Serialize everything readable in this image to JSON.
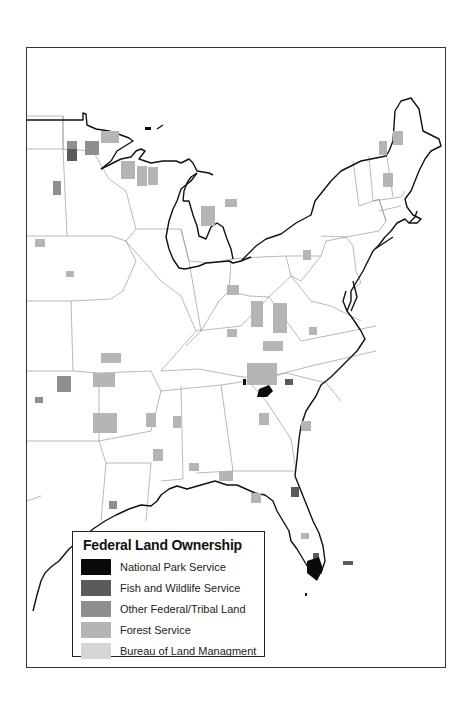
{
  "map": {
    "subject": "Eastern United States",
    "frame": {
      "left": 26,
      "top": 47,
      "right": 448,
      "bottom": 670
    }
  },
  "legend": {
    "title": "Federal Land Ownership",
    "items": [
      {
        "label": "National Park Service",
        "color": "#0a0a0a",
        "icon": "national-park-service-swatch"
      },
      {
        "label": "Fish and Wildlife Service",
        "color": "#5a5a5a",
        "icon": "fish-wildlife-service-swatch"
      },
      {
        "label": "Other Federal/Tribal Land",
        "color": "#8f8f8f",
        "icon": "other-federal-tribal-swatch"
      },
      {
        "label": "Forest Service",
        "color": "#b5b5b5",
        "icon": "forest-service-swatch"
      },
      {
        "label": "Bureau of Land Managment",
        "color": "#d6d6d6",
        "icon": "blm-swatch"
      }
    ]
  },
  "colors": {
    "outline": "#111111",
    "state_border": "#8a8a8a",
    "background": "#ffffff"
  }
}
